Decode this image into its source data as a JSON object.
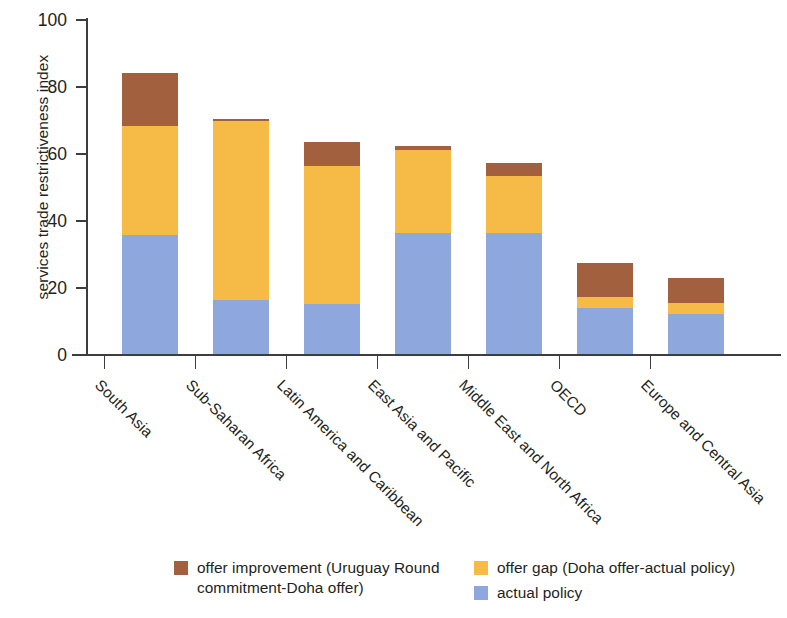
{
  "chart_data": {
    "type": "bar",
    "subtype": "stacked-vertical",
    "title": "",
    "xlabel": "",
    "ylabel": "services trade restrictiveness index",
    "ylim": [
      0,
      100
    ],
    "yticks": [
      0,
      20,
      40,
      60,
      80,
      100
    ],
    "grid": false,
    "legend_position": "bottom",
    "stack_order_bottom_to_top": [
      "actual policy",
      "offer gap (Doha offer-actual policy)",
      "offer improvement (Uruguay Round commitment-Doha offer)"
    ],
    "categories": [
      "South Asia",
      "Sub-Saharan Africa",
      "Latin America and Caribbean",
      "East Asia and Pacific",
      "Middle East and North Africa",
      "OECD",
      "Europe and Central Asia"
    ],
    "series": [
      {
        "name": "actual policy",
        "color": "#8ea7dd",
        "values": [
          35.5,
          16.0,
          14.8,
          36.0,
          36.0,
          13.8,
          11.8
        ]
      },
      {
        "name": "offer gap (Doha offer-actual policy)",
        "color": "#f6ba47",
        "values": [
          32.5,
          53.5,
          41.2,
          25.0,
          17.0,
          3.2,
          3.4
        ]
      },
      {
        "name": "offer improvement (Uruguay Round commitment-Doha offer)",
        "color": "#a2603e",
        "values": [
          16.0,
          0.8,
          7.2,
          1.0,
          4.0,
          10.2,
          7.4
        ]
      }
    ],
    "totals": [
      84.0,
      70.3,
      63.2,
      62.0,
      57.0,
      27.2,
      22.6
    ]
  },
  "axis": {
    "y_title": "services trade restrictiveness index",
    "y_tick_labels": [
      "100",
      "80",
      "60",
      "40",
      "20",
      "0"
    ]
  },
  "legend": {
    "entries": [
      {
        "key": "offer-improvement",
        "color": "#a2603e",
        "line1": "offer improvement (Uruguay Round",
        "line2": "commitment-Doha offer)"
      },
      {
        "key": "offer-gap",
        "color": "#f6ba47",
        "line1": "offer gap (Doha offer-actual policy)",
        "line2": ""
      },
      {
        "key": "actual-policy",
        "color": "#8ea7dd",
        "line1": "actual policy",
        "line2": ""
      }
    ]
  },
  "colors": {
    "brown": "#a2603e",
    "yellow": "#f6ba47",
    "blue": "#8ea7dd",
    "axis": "#3d3d3d",
    "text": "#231f20",
    "background": "#ffffff"
  }
}
